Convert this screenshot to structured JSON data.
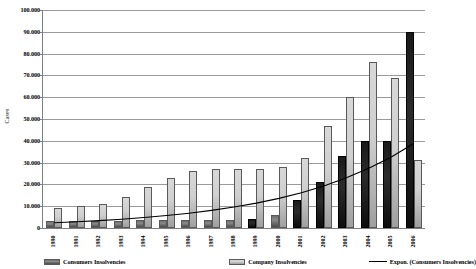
{
  "chart_data": {
    "type": "bar",
    "title": "",
    "xlabel": "",
    "ylabel": "Cases",
    "ylim": [
      0,
      100000
    ],
    "ytick_step": 10000,
    "grid": true,
    "legend_position": "bottom",
    "categories": [
      "1990",
      "1991",
      "1992",
      "1993",
      "1994",
      "1995",
      "1996",
      "1997",
      "1998",
      "1999",
      "2000",
      "2001",
      "2002",
      "2003",
      "2004",
      "2005",
      "2006"
    ],
    "ytick_labels": [
      "100.000",
      "90.000",
      "80.000",
      "70.000",
      "60.000",
      "50.000",
      "40.000",
      "30.000",
      "20.000",
      "10.000",
      "0"
    ],
    "series": [
      {
        "name": "Consumers Insolvencies",
        "kind": "bar",
        "color": "#6e6e6e",
        "values": [
          3000,
          3000,
          3000,
          3000,
          3500,
          3500,
          3500,
          3500,
          3500,
          4000,
          6000,
          13000,
          21000,
          33000,
          40000,
          40000,
          90000
        ]
      },
      {
        "name": "Company Insolvencies",
        "kind": "bar",
        "color": "#cfcfcf",
        "values": [
          9000,
          10000,
          11000,
          14000,
          19000,
          23000,
          26000,
          27000,
          27000,
          27000,
          28000,
          32000,
          47000,
          60000,
          76000,
          69000,
          31000
        ]
      },
      {
        "name": "Expon. (Consumers Insolvencies)",
        "kind": "line",
        "color": "#000000",
        "values": [
          2400,
          2900,
          3400,
          4000,
          4800,
          5700,
          6800,
          8100,
          9600,
          11400,
          13600,
          16200,
          19300,
          23000,
          27400,
          32600,
          38800
        ]
      }
    ]
  },
  "legend": {
    "consumers_label": "Consumers Insolvencies",
    "company_label": "Company Insolvencies",
    "trend_label": "Expon. (Consumers Insolvencies)"
  },
  "axis": {
    "y_title": "Cases"
  }
}
